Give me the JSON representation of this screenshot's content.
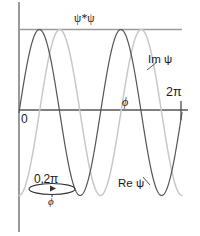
{
  "figure": {
    "title": "",
    "background_color": "#ffffff"
  },
  "labels": {
    "psi_squared": "ψ*ψ",
    "origin": "0",
    "two_pi": "2π",
    "phi_axis": "ϕ",
    "im_psi": "Im ψ",
    "re_psi": "Re ψ",
    "ring_range": "0,2π",
    "ring_phi": "ϕ"
  },
  "colors": {
    "axis": "#808080",
    "re_curve": "#555555",
    "im_curve": "#c8c8c8",
    "psi_squared_line": "#9a9a9a",
    "text": "#1a1a1a",
    "annotation": "#333333"
  },
  "chart_data": {
    "type": "line",
    "title": "",
    "xlabel": "ϕ",
    "ylabel": "",
    "xlim": [
      0,
      6.283185307179586
    ],
    "ylim": [
      -1.12,
      1.0
    ],
    "xticks": [
      0,
      6.283185307179586
    ],
    "xticklabels": [
      "0",
      "2π"
    ],
    "yticks": [],
    "yticklabels": [],
    "grid": false,
    "legend": "inline-annotations",
    "annotations": [
      {
        "text": "ψ*ψ",
        "x": 2.6,
        "y": 1.0,
        "note": "constant probability density line at y = 1"
      },
      {
        "text": "Im ψ",
        "x": 5.2,
        "y": 0.68,
        "note": "leader line to light gray curve"
      },
      {
        "text": "Re ψ",
        "x": 4.1,
        "y": -0.82,
        "note": "leader line to dark gray curve"
      },
      {
        "text": "ϕ",
        "x": 4.15,
        "y": 0.17,
        "note": "axis variable label above horizontal axis"
      },
      {
        "text": "2π",
        "x": 6.1,
        "y": 0.3,
        "note": "tick label at right end of axis"
      },
      {
        "text": "0",
        "x": 0.08,
        "y": -0.05,
        "note": "origin label"
      },
      {
        "text": "0,2π",
        "x": 1.1,
        "y": -0.78,
        "note": "ring diagram label above ellipse"
      },
      {
        "text": "ϕ",
        "x": 1.3,
        "y": -1.05,
        "note": "ring diagram label below ellipse"
      }
    ],
    "series": [
      {
        "name": "Re ψ",
        "color": "#555555",
        "formula": "sin(2ϕ)",
        "x": [
          0,
          0.3927,
          0.7854,
          1.1781,
          1.5708,
          1.9635,
          2.3562,
          2.7489,
          3.1416,
          3.5343,
          3.927,
          4.3197,
          4.7124,
          5.1051,
          5.4978,
          5.8905,
          6.2832
        ],
        "values": [
          0,
          0.7071,
          1.0,
          0.7071,
          0,
          -0.7071,
          -1.0,
          -0.7071,
          0,
          0.7071,
          1.0,
          0.7071,
          0,
          -0.7071,
          -1.0,
          -0.7071,
          0
        ]
      },
      {
        "name": "Im ψ",
        "color": "#c8c8c8",
        "formula": "-cos(2ϕ)",
        "x": [
          0,
          0.3927,
          0.7854,
          1.1781,
          1.5708,
          1.9635,
          2.3562,
          2.7489,
          3.1416,
          3.5343,
          3.927,
          4.3197,
          4.7124,
          5.1051,
          5.4978,
          5.8905,
          6.2832
        ],
        "values": [
          -1.0,
          -0.7071,
          0,
          0.7071,
          1.0,
          0.7071,
          0,
          -0.7071,
          -1.0,
          -0.7071,
          0,
          0.7071,
          1.0,
          0.7071,
          0,
          -0.7071,
          -1.0
        ]
      },
      {
        "name": "ψ*ψ",
        "color": "#9a9a9a",
        "formula": "1",
        "x": [
          0,
          6.2832
        ],
        "values": [
          1.0,
          1.0
        ]
      }
    ]
  }
}
